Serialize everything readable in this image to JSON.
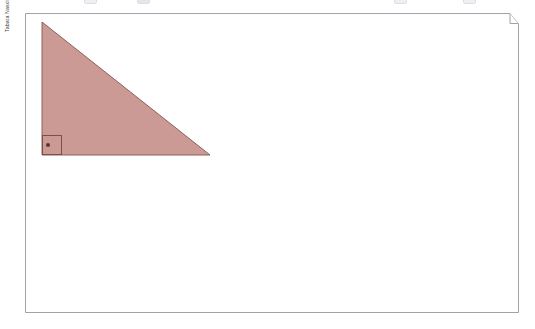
{
  "canvas": {
    "width": 535,
    "height": 329,
    "background": "#ffffff"
  },
  "toolbar": {
    "visible": true,
    "note": "partially cropped toolbar row at very top edge",
    "ghost_controls": [
      {
        "name": "toolbar-control-1",
        "x": 84
      },
      {
        "name": "toolbar-control-2",
        "x": 137
      },
      {
        "name": "toolbar-control-3",
        "x": 394
      },
      {
        "name": "toolbar-control-4",
        "x": 463
      }
    ]
  },
  "document": {
    "frame": {
      "name": "document-page-frame",
      "x": 25,
      "y": 13,
      "width": 493,
      "height": 300,
      "border_color": "#9fa3ac",
      "fill": "#ffffff",
      "corner_notch": {
        "present": true,
        "description": "stepped fold at top-right corner",
        "step_x": 485,
        "step_y": 10
      }
    }
  },
  "axis_label": {
    "name": "vertical-axis-label",
    "text": "Tabata Nascimento",
    "rotation": "-90deg",
    "color": "#3b3f46",
    "font_size_px": 5.2
  },
  "figure": {
    "name": "right-triangle",
    "type": "right-triangle",
    "fill_color": "#cc9a94",
    "stroke_color": "#8c6058",
    "stroke_width": 1,
    "vertices": [
      {
        "label": "apex-top-left",
        "x": 42,
        "y": 22
      },
      {
        "label": "right-angle-bottom-left",
        "x": 42,
        "y": 155
      },
      {
        "label": "bottom-right",
        "x": 210,
        "y": 155
      }
    ],
    "legs": {
      "vertical_px": 133,
      "horizontal_px": 168
    },
    "right_angle_marker": {
      "name": "right-angle-marker",
      "x": 42,
      "y": 135,
      "size": 20,
      "stroke_color": "#7d4f47",
      "dot_color": "#5a332c",
      "dot_radius": 2
    }
  }
}
